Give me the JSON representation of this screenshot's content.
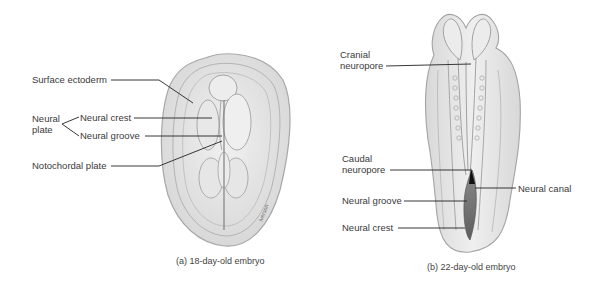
{
  "figure_a": {
    "caption": "(a) 18-day-old embryo",
    "labels": {
      "surface_ectoderm": "Surface ectoderm",
      "neural_plate_line1": "Neural",
      "neural_plate_line2": "plate",
      "neural_crest": "Neural crest",
      "neural_groove": "Neural groove",
      "notochordal_plate": "Notochordal plate"
    },
    "signature": "Iverson"
  },
  "figure_b": {
    "caption": "(b) 22-day-old embryo",
    "labels": {
      "cranial_line1": "Cranial",
      "cranial_line2": "neuropore",
      "caudal_line1": "Caudal",
      "caudal_line2": "neuropore",
      "neural_canal": "Neural canal",
      "neural_groove": "Neural groove",
      "neural_crest": "Neural crest"
    }
  },
  "colors": {
    "tissue_fill": "#e4e4e4",
    "tissue_stroke": "#9a9a9a",
    "leader_line": "#222222",
    "groove_dark": "#6e6e6e"
  }
}
